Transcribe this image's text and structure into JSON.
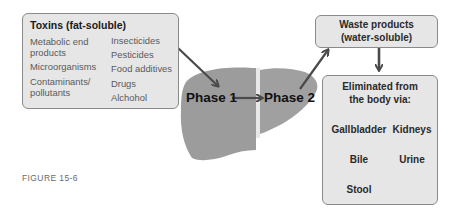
{
  "toxins_box": {
    "title": "Toxins (fat-soluble)",
    "column1": [
      "Metabolic end products",
      "Microorganisms",
      "Contaminants/ pollutants"
    ],
    "column2": [
      "Insecticides",
      "Pesticides",
      "Food additives",
      "Drugs",
      "Alchohol"
    ]
  },
  "liver": {
    "phase1_label": "Phase 1",
    "phase2_label": "Phase 2"
  },
  "waste_box": {
    "line1": "Waste products",
    "line2": "(water-soluble)"
  },
  "eliminated_box": {
    "line1": "Eliminated from",
    "line2": "the body via:",
    "pathways": [
      {
        "steps": [
          "Gallbladder",
          "Bile",
          "Stool"
        ]
      },
      {
        "steps": [
          "Kidneys",
          "Urine"
        ]
      }
    ]
  },
  "caption": "FIGURE 15-6",
  "colors": {
    "box_fill": "#e6e6e6",
    "box_border": "#8a8a8a",
    "liver_fill": "#9a9a9a",
    "arrow": "#4a4a4a"
  }
}
